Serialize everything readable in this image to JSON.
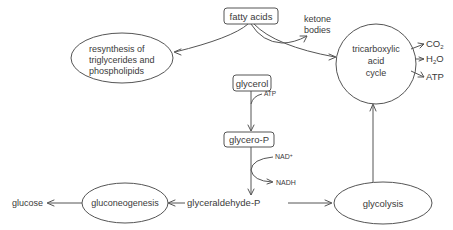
{
  "diagram": {
    "nodes": {
      "fatty_acids": "fatty acids",
      "resynthesis": [
        "resynthesis of",
        "triglycerides and",
        "phospholipids"
      ],
      "ketone_bodies": [
        "ketone",
        "bodies"
      ],
      "tca_cycle": [
        "tricarboxylic",
        "acid",
        "cycle"
      ],
      "co2": "CO",
      "co2_sub": "2",
      "h2o_h": "H",
      "h2o_sub": "2",
      "h2o_o": "O",
      "atp_out": "ATP",
      "glycerol": "glycerol",
      "atp_in": "ATP",
      "glycero_p": "glycero-P",
      "nad": "NAD",
      "nad_sup": "+",
      "nadh": "NADH",
      "glyceraldehyde_p": "glyceraldehyde-P",
      "glycolysis": "glycolysis",
      "gluconeogenesis": "gluconeogenesis",
      "glucose": "glucose"
    },
    "edges": [
      {
        "from": "fatty acids",
        "to": "resynthesis of triglycerides and phospholipids"
      },
      {
        "from": "fatty acids",
        "to": "ketone bodies"
      },
      {
        "from": "fatty acids",
        "to": "tricarboxylic acid cycle"
      },
      {
        "from": "tricarboxylic acid cycle",
        "to": "CO2"
      },
      {
        "from": "tricarboxylic acid cycle",
        "to": "H2O"
      },
      {
        "from": "tricarboxylic acid cycle",
        "to": "ATP"
      },
      {
        "from": "glycerol",
        "to": "glycero-P",
        "cofactor": "ATP"
      },
      {
        "from": "glycero-P",
        "to": "glyceraldehyde-P",
        "cofactor_in": "NAD+",
        "cofactor_out": "NADH"
      },
      {
        "from": "glyceraldehyde-P",
        "to": "glycolysis"
      },
      {
        "from": "glycolysis",
        "to": "tricarboxylic acid cycle"
      },
      {
        "from": "glyceraldehyde-P",
        "to": "gluconeogenesis"
      },
      {
        "from": "gluconeogenesis",
        "to": "glucose"
      }
    ],
    "colors": {
      "stroke": "#555555",
      "text": "#3a3a3a",
      "background": "#ffffff"
    }
  }
}
